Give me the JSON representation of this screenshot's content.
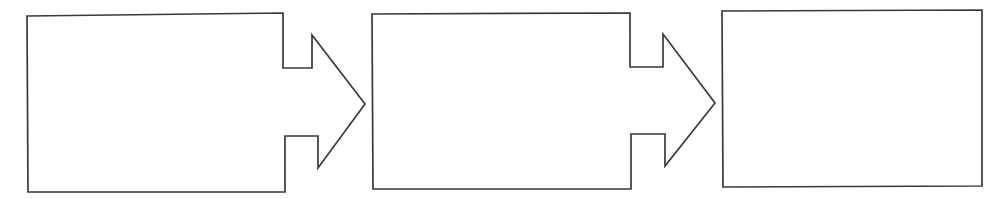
{
  "document": {
    "title": "Blank three-stage process flow diagram",
    "type": "diagram",
    "background_color": "#ffffff",
    "line_color": "#3a3a3c",
    "fill_color": "#ffffff",
    "canvas": {
      "width": 997,
      "height": 199
    }
  },
  "diagram": {
    "orientation": "left-to-right",
    "stage_count": 3,
    "connector_count": 2,
    "stages": [
      {
        "id": "stage-1",
        "label": "",
        "order": "1",
        "has_outgoing_arrow": "true",
        "box": {
          "x": 27,
          "y": 15,
          "width": 256,
          "height": 177
        }
      },
      {
        "id": "stage-2",
        "label": "",
        "order": "2",
        "has_outgoing_arrow": "true",
        "box": {
          "x": 372,
          "y": 14,
          "width": 258,
          "height": 175
        }
      },
      {
        "id": "stage-3",
        "label": "",
        "order": "3",
        "has_outgoing_arrow": "false",
        "box": {
          "x": 722,
          "y": 10,
          "width": 260,
          "height": 176
        }
      }
    ],
    "connectors": [
      {
        "id": "connector-1",
        "label": "",
        "shape": "block-arrow-right",
        "from": "stage-1",
        "to": "stage-2",
        "tip": {
          "x": 365,
          "y": 104
        }
      },
      {
        "id": "connector-2",
        "label": "",
        "shape": "block-arrow-right",
        "from": "stage-2",
        "to": "stage-3",
        "tip": {
          "x": 715,
          "y": 103
        }
      }
    ]
  }
}
